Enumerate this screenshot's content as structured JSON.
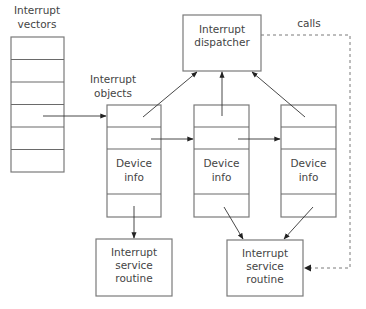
{
  "diagram": {
    "title": "",
    "labels": {
      "vectors_line1": "Interrupt",
      "vectors_line2": "vectors",
      "objects_line1": "Interrupt",
      "objects_line2": "objects",
      "dispatcher_line1": "Interrupt",
      "dispatcher_line2": "dispatcher",
      "calls": "calls"
    },
    "interrupt_objects": [
      {
        "info_line1": "Device",
        "info_line2": "info"
      },
      {
        "info_line1": "Device",
        "info_line2": "info"
      },
      {
        "info_line1": "Device",
        "info_line2": "info"
      }
    ],
    "service_routines": [
      {
        "line1": "Interrupt",
        "line2": "service",
        "line3": "routine"
      },
      {
        "line1": "Interrupt",
        "line2": "service",
        "line3": "routine"
      }
    ],
    "vector_rows": 6,
    "colors": {
      "box_stroke": "#7a7a7a",
      "arrow": "#333333",
      "text": "#444444"
    }
  }
}
